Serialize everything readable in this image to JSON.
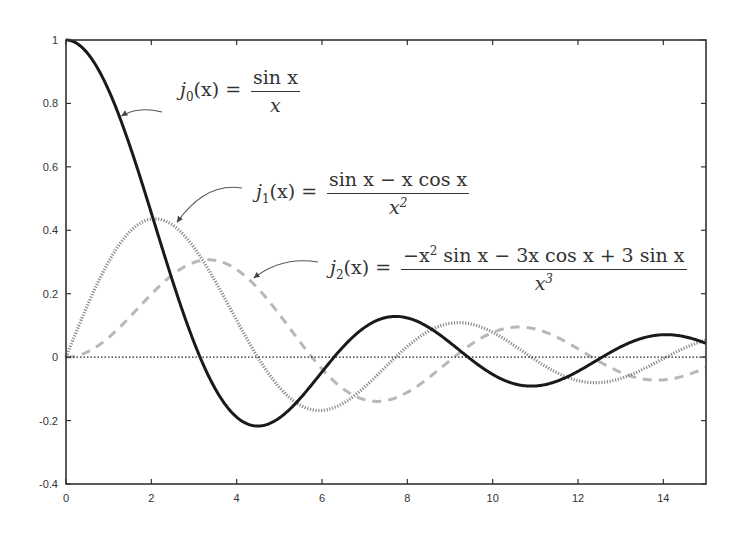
{
  "chart_data": {
    "type": "line",
    "title": "",
    "xlabel": "",
    "ylabel": "",
    "xlim": [
      0,
      15
    ],
    "ylim": [
      -0.4,
      1
    ],
    "grid": false,
    "legend": "inline annotations with arrows",
    "x_ticks": [
      0,
      2,
      4,
      6,
      8,
      10,
      12,
      14
    ],
    "x_tick_labels": [
      "0",
      "2",
      "4",
      "6",
      "8",
      "10",
      "12",
      "14"
    ],
    "y_ticks": [
      -0.4,
      -0.2,
      0,
      0.2,
      0.4,
      0.6,
      0.8,
      1
    ],
    "y_tick_labels": [
      "-0.4",
      "-0.2",
      "0",
      "0.2",
      "0.4",
      "0.6",
      "0.8",
      "1"
    ],
    "zero_line": {
      "y": 0,
      "style": "dotted",
      "color": "#222222"
    },
    "x": [
      0,
      0.5,
      1,
      1.5,
      2,
      2.5,
      3,
      3.5,
      4,
      4.5,
      5,
      5.5,
      6,
      6.5,
      7,
      7.5,
      8,
      8.5,
      9,
      9.5,
      10,
      10.5,
      11,
      11.5,
      12,
      12.5,
      13,
      13.5,
      14,
      14.5,
      15
    ],
    "series": [
      {
        "name": "j0(x) = sin x / x",
        "function": "j0",
        "style": "solid",
        "color": "#1a1a1a",
        "width": 3,
        "values": [
          1,
          0.959,
          0.841,
          0.665,
          0.455,
          0.239,
          0.047,
          -0.1,
          -0.189,
          -0.217,
          -0.192,
          -0.128,
          -0.047,
          0.033,
          0.094,
          0.125,
          0.124,
          0.094,
          0.046,
          -0.008,
          -0.054,
          -0.084,
          -0.091,
          -0.076,
          -0.045,
          -0.005,
          0.032,
          0.059,
          0.071,
          0.064,
          0.043
        ]
      },
      {
        "name": "j1(x) = (sin x - x cos x) / x^2",
        "function": "j1",
        "style": "dotted",
        "color": "#8a8a8a",
        "width": 3,
        "values": [
          0,
          0.163,
          0.301,
          0.396,
          0.435,
          0.416,
          0.346,
          0.239,
          0.116,
          -0.001,
          -0.095,
          -0.156,
          -0.168,
          -0.134,
          -0.063,
          0.009,
          0.063,
          0.091,
          0.104,
          0.095,
          0.078,
          0.041,
          0.008,
          -0.038,
          -0.067,
          -0.081,
          -0.068,
          -0.045,
          -0.013,
          0.02,
          0.047
        ]
      },
      {
        "name": "j2(x) = (-x^2 sin x - 3x cos x + 3 sin x) / x^3",
        "function": "j2",
        "style": "dashed",
        "color": "#b8b8b8",
        "width": 3,
        "values": [
          0,
          0.016,
          0.062,
          0.127,
          0.198,
          0.259,
          0.299,
          0.305,
          0.273,
          0.207,
          0.135,
          0.043,
          -0.06,
          -0.133,
          -0.152,
          -0.139,
          -0.103,
          -0.034,
          0.033,
          0.081,
          0.077,
          0.087,
          0.083,
          0.057,
          0.02,
          -0.016,
          -0.061,
          -0.078,
          -0.081,
          -0.071,
          -0.043
        ]
      }
    ],
    "annotations": [
      {
        "label_lhs": "j",
        "label_sub": "0",
        "label_arg": "(x) =",
        "numerator": "sin x",
        "denominator": "x",
        "arrow_to_x": 1.3
      },
      {
        "label_lhs": "j",
        "label_sub": "1",
        "label_arg": "(x) =",
        "numerator": "sin x − x cos x",
        "denominator": "x",
        "denominator_sup": "2",
        "arrow_to_x": 2.6
      },
      {
        "label_lhs": "j",
        "label_sub": "2",
        "label_arg": "(x) =",
        "numerator_parts": [
          "−x",
          "2",
          " sin x − 3x cos x + 3 sin x"
        ],
        "denominator": "x",
        "denominator_sup": "3",
        "arrow_to_x": 4.4
      }
    ]
  }
}
